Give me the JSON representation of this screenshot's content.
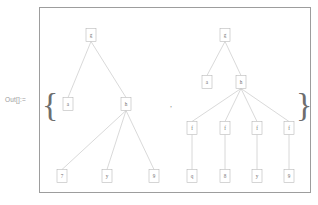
{
  "cell": {
    "out_label": "Out[]:=",
    "open_brace": "{",
    "close_brace": "}",
    "separator": ","
  },
  "trees": [
    {
      "name": "left-tree",
      "nodes": [
        {
          "id": "L0",
          "label": "g",
          "x": 91,
          "y": 35
        },
        {
          "id": "L1",
          "label": "a",
          "x": 68,
          "y": 104
        },
        {
          "id": "L2",
          "label": "h",
          "x": 126,
          "y": 104
        },
        {
          "id": "L3",
          "label": "7",
          "x": 62,
          "y": 176
        },
        {
          "id": "L4",
          "label": "y",
          "x": 107,
          "y": 176
        },
        {
          "id": "L5",
          "label": "9",
          "x": 154,
          "y": 176
        }
      ],
      "edges": [
        [
          "L0",
          "L1"
        ],
        [
          "L0",
          "L2"
        ],
        [
          "L2",
          "L3"
        ],
        [
          "L2",
          "L4"
        ],
        [
          "L2",
          "L5"
        ]
      ]
    },
    {
      "name": "right-tree",
      "nodes": [
        {
          "id": "R0",
          "label": "g",
          "x": 225,
          "y": 35
        },
        {
          "id": "R1",
          "label": "a",
          "x": 207,
          "y": 82
        },
        {
          "id": "R2",
          "label": "h",
          "x": 241,
          "y": 82
        },
        {
          "id": "R3",
          "label": "f",
          "x": 192,
          "y": 128
        },
        {
          "id": "R4",
          "label": "f",
          "x": 225,
          "y": 128
        },
        {
          "id": "R5",
          "label": "f",
          "x": 257,
          "y": 128
        },
        {
          "id": "R6",
          "label": "f",
          "x": 289,
          "y": 128
        },
        {
          "id": "R7",
          "label": "q",
          "x": 192,
          "y": 176
        },
        {
          "id": "R8",
          "label": "8",
          "x": 225,
          "y": 176
        },
        {
          "id": "R9",
          "label": "y",
          "x": 257,
          "y": 176
        },
        {
          "id": "R10",
          "label": "9",
          "x": 289,
          "y": 176
        }
      ],
      "edges": [
        [
          "R0",
          "R1"
        ],
        [
          "R0",
          "R2"
        ],
        [
          "R2",
          "R3"
        ],
        [
          "R2",
          "R4"
        ],
        [
          "R2",
          "R5"
        ],
        [
          "R2",
          "R6"
        ],
        [
          "R3",
          "R7"
        ],
        [
          "R4",
          "R8"
        ],
        [
          "R5",
          "R9"
        ],
        [
          "R6",
          "R10"
        ]
      ]
    }
  ],
  "style": {
    "node_width": 10,
    "node_height": 13,
    "node_fill": "#ffffff",
    "node_stroke": "#b3b3b3",
    "edge_stroke": "#b9b9b9",
    "text_color": "#6f6f6f",
    "frame_stroke": "#9d9d9d"
  }
}
